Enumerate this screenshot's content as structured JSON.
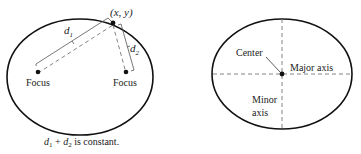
{
  "left_figure": {
    "point_label": "(x, y)",
    "d1_label": "d",
    "d1_sub": "1",
    "d2_label": "d",
    "d2_sub": "2",
    "focus_left_label": "Focus",
    "focus_right_label": "Focus",
    "caption_d1": "d",
    "caption_sub1": "1",
    "caption_plus": " + ",
    "caption_d2": "d",
    "caption_sub2": "2",
    "caption_rest": " is constant."
  },
  "right_figure": {
    "center_label": "Center",
    "major_axis_label": "Major axis",
    "minor_axis_label_line1": "Minor",
    "minor_axis_label_line2": "axis"
  },
  "colors": {
    "stroke": "#111111",
    "dashed": "#777777",
    "text": "#222222"
  }
}
